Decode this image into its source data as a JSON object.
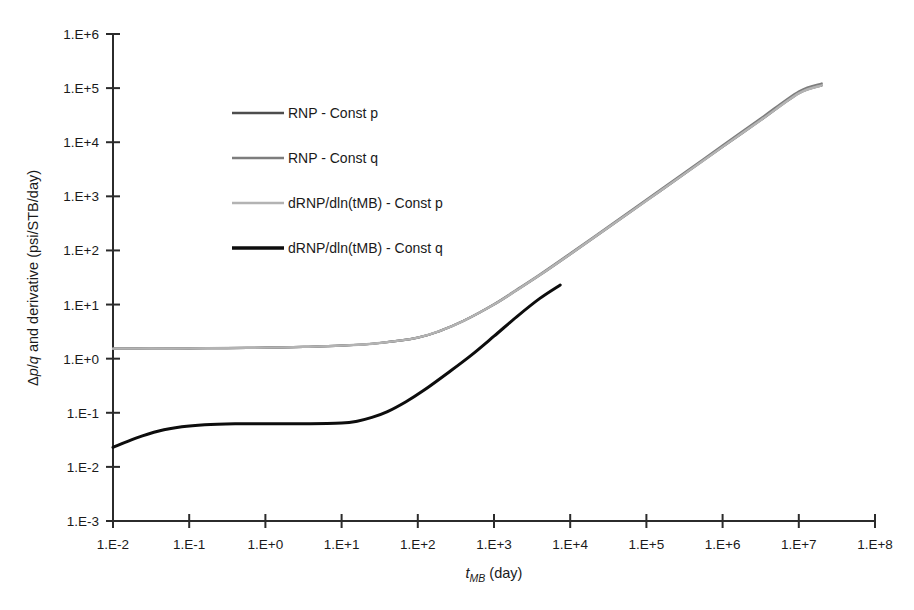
{
  "chart_data": {
    "type": "line",
    "title": "",
    "xlabel": "t_MB (day)",
    "xlabel_parts": {
      "base": "t",
      "subscript": "MB",
      "unit": " (day)"
    },
    "ylabel": "Δp/q and derivative (psi/STB/day)",
    "ylabel_parts": {
      "pre": "Δ",
      "i1": "p",
      "mid": "/",
      "i2": "q",
      "post": " and derivative (psi/STB/day)"
    },
    "xscale": "log",
    "yscale": "log",
    "xlim": [
      0.01,
      100000000
    ],
    "ylim": [
      0.001,
      1000000
    ],
    "grid": false,
    "legend_position": "inside-upper-left",
    "xticks": [
      "1.E-2",
      "1.E-1",
      "1.E+0",
      "1.E+1",
      "1.E+2",
      "1.E+3",
      "1.E+4",
      "1.E+5",
      "1.E+6",
      "1.E+7",
      "1.E+8"
    ],
    "xtick_values": [
      0.01,
      0.1,
      1,
      10,
      100,
      1000,
      10000,
      100000,
      1000000,
      10000000,
      100000000
    ],
    "yticks": [
      "1.E-3",
      "1.E-2",
      "1.E-1",
      "1.E+0",
      "1.E+1",
      "1.E+2",
      "1.E+3",
      "1.E+4",
      "1.E+5",
      "1.E+6"
    ],
    "ytick_values": [
      0.001,
      0.01,
      0.1,
      1,
      10,
      100,
      1000,
      10000,
      100000,
      1000000
    ],
    "series": [
      {
        "name": "RNP - Const p",
        "color": "#4d4d4d",
        "width": 2.2,
        "points": [
          [
            0.01,
            1.53
          ],
          [
            0.0316,
            1.54
          ],
          [
            0.1,
            1.55
          ],
          [
            0.316,
            1.57
          ],
          [
            1.0,
            1.6
          ],
          [
            3.16,
            1.65
          ],
          [
            10.0,
            1.74
          ],
          [
            31.6,
            1.95
          ],
          [
            100.0,
            2.45
          ],
          [
            200.0,
            3.3
          ],
          [
            400.0,
            5.0
          ],
          [
            1000.0,
            10.0
          ],
          [
            2000.0,
            18.5
          ],
          [
            4000.0,
            35.0
          ],
          [
            10000.0,
            85.0
          ],
          [
            31600.0,
            265.0
          ],
          [
            100000.0,
            830.0
          ],
          [
            316000.0,
            2600.0
          ],
          [
            1000000.0,
            8200.0
          ],
          [
            3160000.0,
            25500.0
          ],
          [
            10000000.0,
            80000.0
          ],
          [
            20000000.0,
            112000.0
          ]
        ]
      },
      {
        "name": "RNP - Const q",
        "color": "#7d7d7d",
        "width": 2.2,
        "points": [
          [
            0.01,
            1.53
          ],
          [
            0.0316,
            1.54
          ],
          [
            0.1,
            1.55
          ],
          [
            0.316,
            1.57
          ],
          [
            1.0,
            1.6
          ],
          [
            3.16,
            1.65
          ],
          [
            10.0,
            1.74
          ],
          [
            31.6,
            1.95
          ],
          [
            100.0,
            2.45
          ],
          [
            200.0,
            3.3
          ],
          [
            400.0,
            5.0
          ],
          [
            1000.0,
            10.2
          ],
          [
            2000.0,
            19.0
          ],
          [
            4000.0,
            36.0
          ],
          [
            10000.0,
            88.0
          ],
          [
            31600.0,
            275.0
          ],
          [
            100000.0,
            870.0
          ],
          [
            316000.0,
            2750.0
          ],
          [
            1000000.0,
            8700.0
          ],
          [
            3160000.0,
            27500.0
          ],
          [
            10000000.0,
            87000.0
          ],
          [
            20000000.0,
            122000.0
          ]
        ]
      },
      {
        "name": "dRNP/dln(tMB) - Const p",
        "color": "#b3b3b3",
        "width": 2.4,
        "points": [
          [
            0.01,
            1.53
          ],
          [
            0.0316,
            1.54
          ],
          [
            0.1,
            1.55
          ],
          [
            0.316,
            1.57
          ],
          [
            1.0,
            1.6
          ],
          [
            3.16,
            1.65
          ],
          [
            10.0,
            1.74
          ],
          [
            31.6,
            1.95
          ],
          [
            100.0,
            2.45
          ],
          [
            200.0,
            3.3
          ],
          [
            400.0,
            5.0
          ],
          [
            1000.0,
            10.0
          ],
          [
            2000.0,
            18.5
          ],
          [
            4000.0,
            35.0
          ],
          [
            10000.0,
            85.0
          ],
          [
            31600.0,
            265.0
          ],
          [
            100000.0,
            830.0
          ],
          [
            316000.0,
            2600.0
          ],
          [
            1000000.0,
            8200.0
          ],
          [
            3160000.0,
            25500.0
          ],
          [
            10000000.0,
            80000.0
          ],
          [
            20000000.0,
            112000.0
          ]
        ]
      },
      {
        "name": "dRNP/dln(tMB) - Const q",
        "color": "#0d0d0d",
        "width": 3.0,
        "points": [
          [
            0.01,
            0.023
          ],
          [
            0.02,
            0.034
          ],
          [
            0.04,
            0.046
          ],
          [
            0.08,
            0.055
          ],
          [
            0.16,
            0.06
          ],
          [
            0.4,
            0.0625
          ],
          [
            1.0,
            0.063
          ],
          [
            3.16,
            0.063
          ],
          [
            10.0,
            0.065
          ],
          [
            16.0,
            0.07
          ],
          [
            25.0,
            0.082
          ],
          [
            40.0,
            0.105
          ],
          [
            70.0,
            0.16
          ],
          [
            120.0,
            0.26
          ],
          [
            250.0,
            0.55
          ],
          [
            500.0,
            1.15
          ],
          [
            1000.0,
            2.6
          ],
          [
            2000.0,
            6.0
          ],
          [
            4000.0,
            13.0
          ],
          [
            7400.0,
            23.0
          ]
        ]
      }
    ]
  },
  "legend": {
    "items": [
      {
        "label": "RNP - Const p",
        "color": "#4d4d4d"
      },
      {
        "label": "RNP - Const q",
        "color": "#7d7d7d"
      },
      {
        "label": "dRNP/dln(tMB) - Const p",
        "color": "#b3b3b3"
      },
      {
        "label": "dRNP/dln(tMB) - Const q",
        "color": "#0d0d0d"
      }
    ]
  }
}
